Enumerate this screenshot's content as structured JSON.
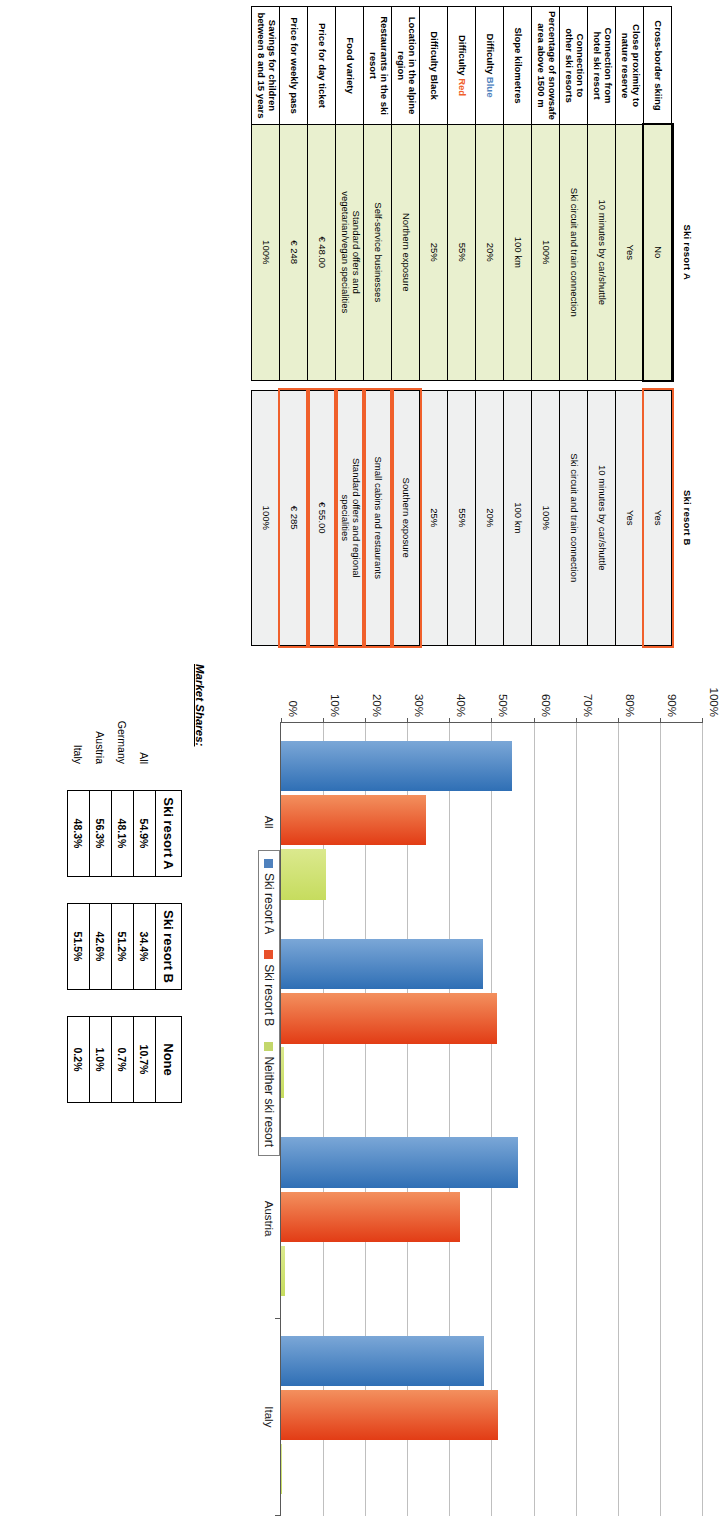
{
  "comparison": {
    "columns": [
      "Ski resort A",
      "Ski resort B"
    ],
    "rows": [
      {
        "label": "Cross-border skiing",
        "a": "No",
        "b": "Yes",
        "b_highlight": true
      },
      {
        "label": "Close proximity to\nnature reserve",
        "a": "Yes",
        "b": "Yes",
        "b_highlight": false
      },
      {
        "label": "Connection from\nhotel ski resort",
        "a": "10 minutes by car/shuttle",
        "b": "10 minutes by car/shuttle",
        "b_highlight": false
      },
      {
        "label": "Connection to\nother ski resorts",
        "a": "Ski circuit and train connection",
        "b": "Ski circuit and train connection",
        "b_highlight": false
      },
      {
        "label": "Percentage of snowsafe\narea above 1500 m",
        "a": "100%",
        "b": "100%",
        "b_highlight": false
      },
      {
        "label": "Slope kilometres",
        "a": "100 km",
        "b": "100 km",
        "b_highlight": false
      },
      {
        "label": "Difficulty Blue",
        "a": "20%",
        "b": "20%",
        "b_highlight": false,
        "label_accent": "blue",
        "accent_word": "Blue",
        "label_base": "Difficulty "
      },
      {
        "label": "Difficulty Red",
        "a": "55%",
        "b": "55%",
        "b_highlight": false,
        "label_accent": "red",
        "accent_word": "Red",
        "label_base": "Difficulty "
      },
      {
        "label": "Difficulty Black",
        "a": "25%",
        "b": "25%",
        "b_highlight": false
      },
      {
        "label": "Location in the alpine region",
        "a": "Northern exposure",
        "b": "Southern exposure",
        "b_highlight": true
      },
      {
        "label": "Restaurants in the ski resort",
        "a": "Self-service businesses",
        "b": "Small cabins and restaurants",
        "b_highlight": true
      },
      {
        "label": "Food variety",
        "a": "Standard offers and\nvegetarian/vegan specialities",
        "b": "Standard offers and regional\nspecialities",
        "b_highlight": true
      },
      {
        "label": "Price for day ticket",
        "a": "€ 48.00",
        "b": "€ 55.00",
        "b_highlight": true
      },
      {
        "label": "Price for weekly pass",
        "a": "€ 248",
        "b": "€ 285",
        "b_highlight": true
      },
      {
        "label": "Savings for children\nbetween 8 and 15 years",
        "a": "100%",
        "b": "100%",
        "b_highlight": false
      }
    ]
  },
  "chart_data": {
    "type": "bar",
    "title": "",
    "xlabel": "",
    "ylabel": "",
    "categories": [
      "All",
      "Germany",
      "Austria",
      "Italy"
    ],
    "series": [
      {
        "name": "Ski resort A",
        "color": "#4f81bd",
        "values": [
          54.9,
          48.1,
          56.3,
          48.3
        ]
      },
      {
        "name": "Ski resort B",
        "color": "#e8502a",
        "values": [
          34.4,
          51.2,
          42.6,
          51.5
        ]
      },
      {
        "name": "Neither ski resort",
        "color": "#c3d76b",
        "values": [
          10.7,
          0.7,
          1.0,
          0.2
        ]
      }
    ],
    "ylim": [
      0,
      100
    ],
    "yticks": [
      "0%",
      "10%",
      "20%",
      "30%",
      "40%",
      "50%",
      "60%",
      "70%",
      "80%",
      "90%",
      "100%"
    ],
    "ytick_values": [
      0,
      10,
      20,
      30,
      40,
      50,
      60,
      70,
      80,
      90,
      100
    ],
    "grid": true,
    "legend_position": "below-plot",
    "legend": [
      "Ski resort A",
      "Ski resort B",
      "Neither ski resort"
    ]
  },
  "market_shares": {
    "title": "Market Shares:",
    "row_labels": [
      "All",
      "Germany",
      "Austria",
      "Italy"
    ],
    "tables": [
      {
        "header": "Ski resort A",
        "values": [
          "54.9%",
          "48.1%",
          "56.3%",
          "48.3%"
        ]
      },
      {
        "header": "Ski resort B",
        "values": [
          "34.4%",
          "51.2%",
          "42.6%",
          "51.5%"
        ]
      },
      {
        "header": "None",
        "values": [
          "10.7%",
          "0.7%",
          "1.0%",
          "0.2%"
        ]
      }
    ]
  },
  "colors": {
    "resort_a": "#4f81bd",
    "resort_b": "#e8502a",
    "neither": "#c3d76b",
    "col_a_fill": "#e9f0cf",
    "col_b_fill": "#eff0f0",
    "highlight": "#f0602b"
  }
}
